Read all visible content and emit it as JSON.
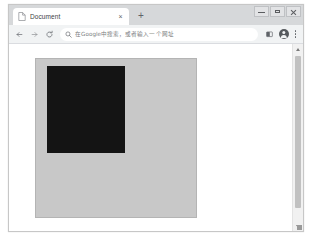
{
  "window": {
    "controls": [
      {
        "name": "minimize",
        "label": "—"
      },
      {
        "name": "maximize",
        "label": "□"
      },
      {
        "name": "close",
        "label": "✕"
      }
    ]
  },
  "tab_strip": {
    "tabs": [
      {
        "favicon": "document-icon",
        "title": "Document",
        "close_label": "×",
        "active": true
      }
    ],
    "new_tab_label": "+"
  },
  "toolbar": {
    "back_icon": "back-arrow-icon",
    "forward_icon": "forward-arrow-icon",
    "reload_icon": "reload-icon",
    "omnibox": {
      "search_icon": "search-icon",
      "value": "",
      "placeholder": "在Google中搜索，或者输入一个网址"
    },
    "media_icon": "media-cast-icon",
    "avatar_icon": "profile-avatar-icon",
    "menu_icon": "three-dot-menu-icon"
  },
  "page": {
    "outer_box": {
      "name": "gray-outer-square",
      "color": "#c8c8c8",
      "border_color": "#b4b4b4"
    },
    "inner_box": {
      "name": "black-inner-square",
      "color": "#141414"
    }
  },
  "scrollbar": {
    "up_arrow": "scroll-up-arrow",
    "down_arrow": "scroll-down-arrow",
    "thumb": "scrollbar-thumb"
  }
}
